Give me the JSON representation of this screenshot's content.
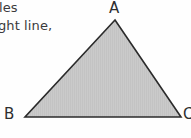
{
  "page": {
    "background_color": "#ffffff",
    "width": 191,
    "height": 138
  },
  "text_fragments": [
    {
      "id": "line-1",
      "text": "les"
    },
    {
      "id": "line-2",
      "text": "ght line,"
    }
  ],
  "figure": {
    "type": "triangle",
    "fill_color": "#c9c9c9",
    "stroke_color": "#2b2b2b",
    "stroke_width": 1.6,
    "vertices": [
      {
        "label": "A",
        "x": 115,
        "y": 20
      },
      {
        "label": "B",
        "x": 25,
        "y": 117
      },
      {
        "label": "C",
        "x": 181,
        "y": 117
      }
    ],
    "labels": {
      "a": "A",
      "b": "B",
      "c": "C"
    }
  }
}
